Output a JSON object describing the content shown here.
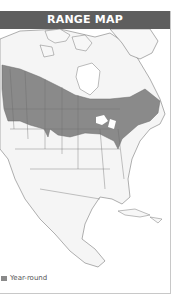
{
  "header": {
    "title": "RANGE MAP"
  },
  "map": {
    "region": "North America",
    "range_color": "#8a8a8a",
    "land_color": "#f4f4f4",
    "border_color": "#6a6a6a"
  },
  "legend": {
    "items": [
      {
        "label": "Year-round",
        "color": "#8a8a8a",
        "icon": "swatch-icon"
      }
    ]
  }
}
